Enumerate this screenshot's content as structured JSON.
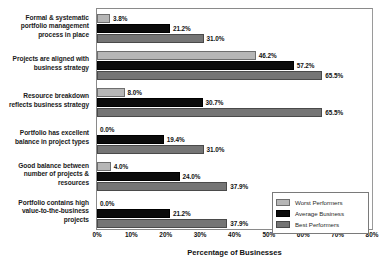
{
  "chart_data": {
    "type": "bar",
    "orientation": "horizontal",
    "title": "",
    "xlabel": "Percentage of Businesses",
    "ylabel": "",
    "xlim": [
      0,
      80
    ],
    "xticks": [
      "0%",
      "10%",
      "20%",
      "30%",
      "40%",
      "50%",
      "60%",
      "70%",
      "80%"
    ],
    "grid": false,
    "legend_position": "bottom-right",
    "categories": [
      "Formal & systematic portfolio management process in place",
      "Projects are aligned with business strategy",
      "Resource breakdown reflects business strategy",
      "Portfolio has excellent balance in project types",
      "Good balance between number of projects & resources",
      "Portfolio contains high value-to-the-business projects"
    ],
    "series": [
      {
        "name": "Worst Performers",
        "color": "#b6b6b6",
        "values": [
          3.8,
          46.2,
          8.0,
          0.0,
          4.0,
          0.0
        ],
        "labels": [
          "3.8%",
          "46.2%",
          "8.0%",
          "0.0%",
          "4.0%",
          "0.0%"
        ]
      },
      {
        "name": "Average Business",
        "color": "#0b0b0b",
        "values": [
          21.2,
          57.2,
          30.7,
          19.4,
          24.0,
          21.2
        ],
        "labels": [
          "21.2%",
          "57.2%",
          "30.7%",
          "19.4%",
          "24.0%",
          "21.2%"
        ]
      },
      {
        "name": "Best Performers",
        "color": "#757575",
        "values": [
          31.0,
          65.5,
          65.5,
          31.0,
          37.9,
          37.9
        ],
        "labels": [
          "31.0%",
          "65.5%",
          "65.5%",
          "31.0%",
          "37.9%",
          "37.9%"
        ]
      }
    ]
  },
  "axis": {
    "x_title": "Percentage of Businesses",
    "ticks": [
      "0%",
      "10%",
      "20%",
      "30%",
      "40%",
      "50%",
      "60%",
      "70%",
      "80%"
    ]
  },
  "categories": {
    "c0": "Formal & systematic portfolio management process in place",
    "c1": "Projects are aligned with business strategy",
    "c2": "Resource breakdown reflects business strategy",
    "c3": "Portfolio has excellent balance in project types",
    "c4": "Good balance between number of projects & resources",
    "c5": "Portfolio contains high value-to-the-business projects"
  },
  "legend": {
    "items": [
      {
        "label": "Worst Performers",
        "color": "#b6b6b6"
      },
      {
        "label": "Average Business",
        "color": "#0b0b0b"
      },
      {
        "label": "Best Performers",
        "color": "#757575"
      }
    ]
  }
}
